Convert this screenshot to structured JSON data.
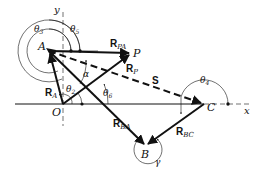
{
  "diagram": {
    "type": "vector-loop-diagram",
    "colors": {
      "stroke": "#111111",
      "background": "#ffffff"
    },
    "points": {
      "A": {
        "label": "A",
        "x": 49,
        "y": 51
      },
      "O": {
        "label": "O",
        "x": 63,
        "y": 104
      },
      "P": {
        "label": "P",
        "x": 131,
        "y": 53
      },
      "B": {
        "label": "B",
        "x": 146,
        "y": 146
      },
      "C": {
        "label": "C",
        "x": 204,
        "y": 104
      }
    },
    "axes": {
      "x_label": "x",
      "y_label": "y"
    },
    "vectors": [
      {
        "name": "R",
        "sub": "A",
        "from": "O",
        "to": "A",
        "style": "solid"
      },
      {
        "name": "R",
        "sub": "PA",
        "from": "A",
        "to": "P",
        "style": "solid"
      },
      {
        "name": "R",
        "sub": "P",
        "from": "O",
        "to": "P",
        "style": "solid"
      },
      {
        "name": "R",
        "sub": "BA",
        "from": "A",
        "to": "B",
        "style": "solid"
      },
      {
        "name": "R",
        "sub": "BC",
        "from": "C",
        "to": "B",
        "style": "solid"
      },
      {
        "name": "S",
        "sub": "",
        "from": "A",
        "to": "C",
        "style": "dashed"
      }
    ],
    "angles": [
      {
        "symbol": "θ",
        "sub": "2"
      },
      {
        "symbol": "θ",
        "sub": "3"
      },
      {
        "symbol": "θ",
        "sub": "4"
      },
      {
        "symbol": "θ",
        "sub": "5"
      },
      {
        "symbol": "θ",
        "sub": "6"
      },
      {
        "symbol": "α",
        "sub": ""
      },
      {
        "symbol": "γ",
        "sub": ""
      }
    ]
  }
}
